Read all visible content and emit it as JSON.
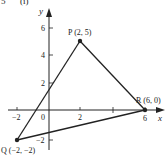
{
  "heading": {
    "number": "5",
    "part": "(i)"
  },
  "axes": {
    "x_label": "x",
    "y_label": "y",
    "x_ticks": [
      {
        "value": -2,
        "label": "−2"
      },
      {
        "value": 0,
        "label": "0"
      },
      {
        "value": 2,
        "label": "2"
      },
      {
        "value": 4,
        "label": ""
      },
      {
        "value": 6,
        "label": "6"
      }
    ],
    "y_ticks": [
      {
        "value": 6,
        "label": "6"
      },
      {
        "value": 4,
        "label": "4"
      },
      {
        "value": 2,
        "label": "2"
      },
      {
        "value": -2,
        "label": "−2"
      }
    ]
  },
  "points": {
    "P": {
      "label": "P (2, 5)",
      "x": 2,
      "y": 5
    },
    "Q": {
      "label": "Q (−2, −2)",
      "x": -2,
      "y": -2
    },
    "R": {
      "label": "R (6, 0)",
      "x": 6,
      "y": 0
    }
  },
  "segments": [
    {
      "from": "P",
      "to": "Q"
    },
    {
      "from": "P",
      "to": "R"
    },
    {
      "from": "Q",
      "to": "R"
    }
  ],
  "colors": {
    "ink": "#222222",
    "background": "#ffffff"
  }
}
